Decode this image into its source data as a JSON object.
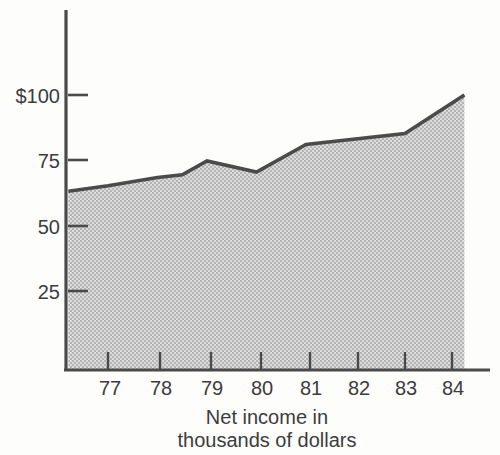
{
  "chart_data": {
    "type": "area",
    "title": "",
    "subtitle": "",
    "caption_line_1": "Net income in",
    "caption_line_2": "thousands of dollars",
    "xlabel": "",
    "ylabel": "",
    "grid": false,
    "legend": "none",
    "xlim": [
      76.2,
      84.3
    ],
    "ylim": [
      0,
      115
    ],
    "y_ticks": [
      25,
      50,
      75,
      100
    ],
    "y_tick_labels": [
      "25",
      "50",
      "75",
      "$100"
    ],
    "x_ticks": [
      77,
      78,
      79,
      80,
      81,
      82,
      83,
      84
    ],
    "x_tick_labels": [
      "77",
      "78",
      "79",
      "80",
      "81",
      "82",
      "83",
      "84"
    ],
    "series": [
      {
        "name": "Net income",
        "x": [
          76.2,
          77,
          78,
          78.5,
          79,
          80,
          81,
          83,
          84.2
        ],
        "values": [
          65,
          67,
          70,
          71,
          76,
          72,
          82,
          86,
          100
        ]
      }
    ],
    "colors": {
      "line": "#4b4b4b",
      "fill": "#c9c9c9",
      "axis": "#4a4a4a",
      "text": "#3c3c3c",
      "background": "#fdfdfc"
    }
  },
  "geometry": {
    "plot_left": 66,
    "plot_right": 470,
    "plot_top": 10,
    "plot_bottom": 370,
    "y_value_at_bottom": 0,
    "y_pixels_per_unit": 2.75,
    "y_pixel_at_zero": 370,
    "x_pixel_at_77": 108,
    "x_pixels_per_year": 49.5
  }
}
